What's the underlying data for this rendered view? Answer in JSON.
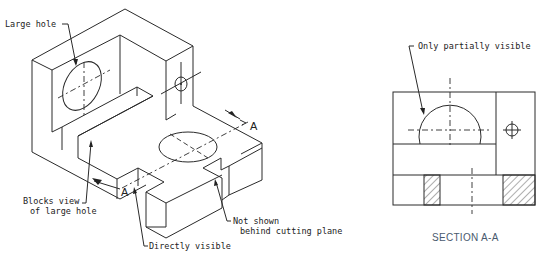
{
  "figure": {
    "isometric_view": {
      "labels": {
        "large_hole": "Large hole",
        "blocks_view_line1": "Blocks view",
        "blocks_view_line2": "of large hole",
        "directly_visible": "Directly visible",
        "not_shown_line1": "Not shown",
        "not_shown_line2": "behind cutting plane"
      },
      "cutting_plane_marks": [
        "A",
        "A"
      ]
    },
    "section_view": {
      "callout": "Only partially visible",
      "caption": "SECTION A-A"
    },
    "colors": {
      "line": "#2a2a2a",
      "caption": "#4a5a6e",
      "background": "#ffffff"
    }
  }
}
